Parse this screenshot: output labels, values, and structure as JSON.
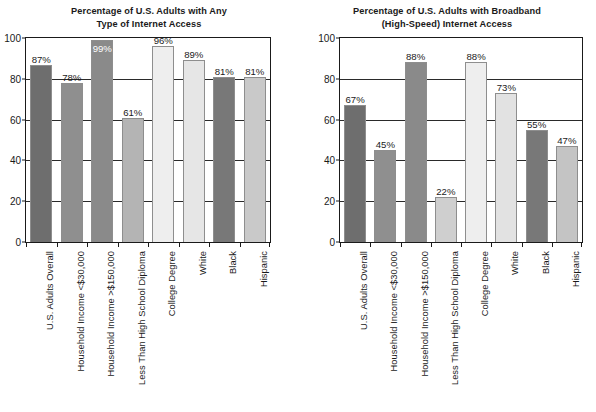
{
  "chart_data": [
    {
      "type": "bar",
      "title": "Percentage of U.S. Adults with Any Type of Internet Access",
      "title_lines": [
        "Percentage of U.S. Adults with Any",
        "Type of Internet Access"
      ],
      "xlabel": "",
      "ylabel": "",
      "ylim": [
        0,
        100
      ],
      "yticks": [
        0,
        20,
        40,
        60,
        80,
        100
      ],
      "ytick_labels": [
        "0",
        "20",
        "40",
        "60",
        "80",
        "100"
      ],
      "grid": true,
      "legend": "none",
      "categories": [
        "U.S. Adults Overall",
        "Household Income <$30,000",
        "Household Income >$150,000",
        "Less Than High School Diploma",
        "College Degree",
        "White",
        "Black",
        "Hispanic"
      ],
      "values": [
        87,
        78,
        99,
        61,
        96,
        89,
        81,
        81
      ],
      "data_labels": [
        "87%",
        "78%",
        "99%",
        "61%",
        "96%",
        "89%",
        "81%",
        "81%"
      ],
      "bar_colors": [
        "#6e6e6e",
        "#8f8f8f",
        "#8a8a8a",
        "#b4b4b4",
        "#eeeeee",
        "#e6e6e6",
        "#787878",
        "#c9c9c9"
      ],
      "label_placement": [
        "outside",
        "outside",
        "inside",
        "outside",
        "outside",
        "outside",
        "outside",
        "outside"
      ]
    },
    {
      "type": "bar",
      "title": "Percentage of U.S. Adults with Broadband (High-Speed) Internet Access",
      "title_lines": [
        "Percentage of U.S. Adults with Broadband",
        "(High-Speed) Internet Access"
      ],
      "xlabel": "",
      "ylabel": "",
      "ylim": [
        0,
        100
      ],
      "yticks": [
        0,
        20,
        40,
        60,
        80,
        100
      ],
      "ytick_labels": [
        "0",
        "20",
        "40",
        "60",
        "80",
        "100"
      ],
      "grid": true,
      "legend": "none",
      "categories": [
        "U.S. Adults Overall",
        "Household Income <$30,000",
        "Household Income >$150,000",
        "Less Than High School Diploma",
        "College Degree",
        "White",
        "Black",
        "Hispanic"
      ],
      "values": [
        67,
        45,
        88,
        22,
        88,
        73,
        55,
        47
      ],
      "data_labels": [
        "67%",
        "45%",
        "88%",
        "22%",
        "88%",
        "73%",
        "55%",
        "47%"
      ],
      "bar_colors": [
        "#6e6e6e",
        "#8f8f8f",
        "#8a8a8a",
        "#cfcfcf",
        "#eeeeee",
        "#e2e2e2",
        "#787878",
        "#c4c4c4"
      ],
      "label_placement": [
        "outside",
        "outside",
        "outside",
        "outside",
        "outside",
        "outside",
        "outside",
        "outside"
      ]
    }
  ]
}
